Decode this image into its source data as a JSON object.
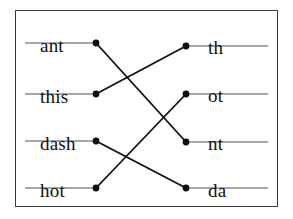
{
  "figure": {
    "type": "bipartite-matching-diagram",
    "title": "",
    "border_color": "#3b3b3b",
    "rule_color": "#8a8a8a",
    "dot_color": "#101010",
    "edge_color": "#101010",
    "background": "#ffffff"
  },
  "left_column": {
    "name": "left-items",
    "line_start_x": 25,
    "line_end_x": 96,
    "items": [
      {
        "label": "ant",
        "y": 43,
        "text_x": 40,
        "text_y": 36
      },
      {
        "label": "this",
        "y": 94,
        "text_x": 40,
        "text_y": 87
      },
      {
        "label": "dash",
        "y": 141,
        "text_x": 40,
        "text_y": 134
      },
      {
        "label": "hot",
        "y": 188,
        "text_x": 40,
        "text_y": 181
      }
    ]
  },
  "right_column": {
    "name": "right-items",
    "line_start_x": 186,
    "line_end_x": 268,
    "items": [
      {
        "label": "th",
        "y": 46,
        "text_x": 208,
        "text_y": 38
      },
      {
        "label": "ot",
        "y": 94,
        "text_x": 208,
        "text_y": 86
      },
      {
        "label": "nt",
        "y": 142,
        "text_x": 208,
        "text_y": 134
      },
      {
        "label": "da",
        "y": 188,
        "text_x": 208,
        "text_y": 181
      }
    ]
  },
  "edges": [
    {
      "name": "edge-ant-nt",
      "from": "ant",
      "to": "nt",
      "x1": 96,
      "y1": 43,
      "x2": 186,
      "y2": 142
    },
    {
      "name": "edge-this-th",
      "from": "this",
      "to": "th",
      "x1": 96,
      "y1": 94,
      "x2": 186,
      "y2": 46
    },
    {
      "name": "edge-dash-da",
      "from": "dash",
      "to": "da",
      "x1": 96,
      "y1": 141,
      "x2": 186,
      "y2": 188
    },
    {
      "name": "edge-hot-ot",
      "from": "hot",
      "to": "ot",
      "x1": 96,
      "y1": 188,
      "x2": 186,
      "y2": 94
    }
  ]
}
